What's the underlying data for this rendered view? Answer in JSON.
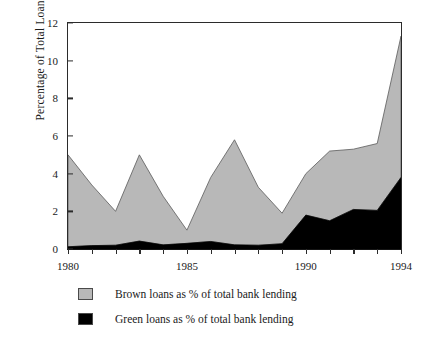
{
  "chart_data": {
    "type": "area",
    "title": "",
    "subtitle": "",
    "xlabel": "",
    "ylabel": "Percentage of Total Loans",
    "stacked": true,
    "grid": false,
    "legend_position": "bottom-left",
    "xlim": [
      1980,
      1994
    ],
    "ylim": [
      0,
      12
    ],
    "yticks": [
      0,
      2,
      4,
      6,
      8,
      10,
      12
    ],
    "ytick_labels": [
      "0",
      "2",
      "4",
      "6",
      "8",
      "10",
      "12"
    ],
    "x": [
      1980,
      1981,
      1982,
      1983,
      1984,
      1985,
      1986,
      1987,
      1988,
      1989,
      1990,
      1991,
      1992,
      1993,
      1994
    ],
    "xticks": [
      1980,
      1981,
      1982,
      1983,
      1984,
      1985,
      1986,
      1987,
      1988,
      1989,
      1990,
      1991,
      1992,
      1993,
      1994
    ],
    "xtick_labels_shown": [
      "1980",
      "1985",
      "1990",
      "1994"
    ],
    "xtick_label_years": [
      1980,
      1985,
      1990,
      1994
    ],
    "series": [
      {
        "name": "Green loans as % of total bank lending",
        "key": "green",
        "color": "#000000",
        "values": [
          0.12,
          0.18,
          0.2,
          0.42,
          0.22,
          0.3,
          0.4,
          0.22,
          0.2,
          0.28,
          1.8,
          1.5,
          2.1,
          2.05,
          3.8
        ]
      },
      {
        "name": "Brown loans as % of total bank lending",
        "key": "brown",
        "color": "#b8b8b8",
        "values": [
          4.88,
          3.22,
          1.8,
          4.58,
          2.58,
          0.7,
          3.4,
          5.58,
          3.08,
          1.62,
          2.2,
          3.7,
          3.2,
          3.55,
          7.5
        ]
      }
    ],
    "totals": [
      5.0,
      3.4,
      2.0,
      5.0,
      2.8,
      1.0,
      3.8,
      5.8,
      3.28,
      1.9,
      4.0,
      5.2,
      5.3,
      5.6,
      11.3
    ]
  },
  "legend": {
    "items": [
      {
        "label": "Brown loans as % of total bank lending",
        "color": "#b8b8b8"
      },
      {
        "label": "Green loans as % of total bank lending",
        "color": "#000000"
      }
    ]
  },
  "axis": {
    "y_title": "Percentage of Total Loans"
  }
}
